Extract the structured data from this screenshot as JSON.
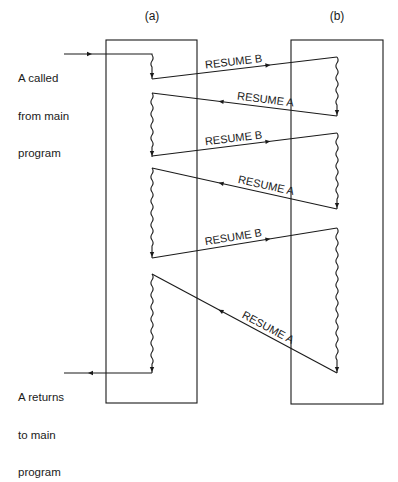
{
  "top_caption_cut": "",
  "columns": [
    {
      "id": "a",
      "label": "(a)",
      "label_x": 152,
      "label_y": 20,
      "box": {
        "x": 106,
        "y": 40,
        "w": 91,
        "h": 363
      },
      "squiggle_x": 152
    },
    {
      "id": "b",
      "label": "(b)",
      "label_x": 337,
      "label_y": 20,
      "box": {
        "x": 291,
        "y": 40,
        "w": 92,
        "h": 364
      },
      "squiggle_x": 337
    }
  ],
  "entry": {
    "text_line1": "A called",
    "text_line2": "from main",
    "text_line3": "program",
    "y": 54,
    "x_from": 64,
    "x_to": 152
  },
  "exit": {
    "text_line1": "A returns",
    "text_line2": "to main",
    "text_line3": "program",
    "y": 373,
    "x_from": 152,
    "x_to": 64
  },
  "segments_a": [
    [
      55,
      79
    ],
    [
      93,
      157
    ],
    [
      168,
      258
    ],
    [
      274,
      373
    ]
  ],
  "segments_b": [
    [
      57,
      116
    ],
    [
      133,
      209
    ],
    [
      228,
      373
    ]
  ],
  "transfers": [
    {
      "label": "RESUME B",
      "from": [
        152,
        79
      ],
      "to": [
        337,
        57
      ]
    },
    {
      "label": "RESUME A",
      "from": [
        337,
        116
      ],
      "to": [
        152,
        93
      ]
    },
    {
      "label": "RESUME B",
      "from": [
        152,
        156
      ],
      "to": [
        337,
        133
      ]
    },
    {
      "label": "RESUME A",
      "from": [
        337,
        209
      ],
      "to": [
        152,
        168
      ]
    },
    {
      "label": "RESUME B",
      "from": [
        152,
        258
      ],
      "to": [
        337,
        228
      ]
    },
    {
      "label": "RESUME A",
      "from": [
        337,
        373
      ],
      "to": [
        152,
        274
      ]
    }
  ],
  "colors": {
    "ink": "#1a1a1a",
    "background": "#ffffff"
  }
}
